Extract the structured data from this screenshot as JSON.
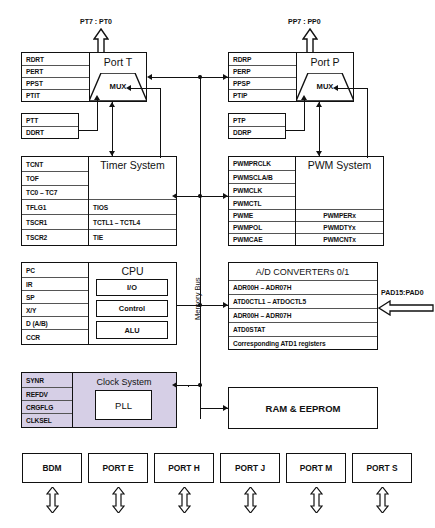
{
  "diagram": {
    "bus_label": "Memory Bus",
    "colors": {
      "line": "#111111",
      "clock_fill": "#d6cfe6",
      "background": "#ffffff"
    }
  },
  "port_t": {
    "header": "Port T",
    "pin_label": "PT7  : PT0",
    "mux_label": "MUX",
    "registers": [
      "RDRT",
      "PERT",
      "PPST",
      "PTIT"
    ],
    "data_registers": [
      "PTT",
      "DDRT"
    ]
  },
  "port_p": {
    "header": "Port P",
    "pin_label": "PP7  : PP0",
    "mux_label": "MUX",
    "registers": [
      "RDRP",
      "PERP",
      "PPSP",
      "PTIP"
    ],
    "data_registers": [
      "PTP",
      "DDRP"
    ]
  },
  "timer_system": {
    "header": "Timer System",
    "left_registers": [
      "TCNT",
      "TOF",
      "TC0 – TC7",
      "TFLG1",
      "TSCR1",
      "TSCR2"
    ],
    "right_registers": [
      "",
      "",
      "",
      "TIOS",
      "TCTL1 – TCTL4",
      "TIE"
    ]
  },
  "pwm_system": {
    "header": "PWM System",
    "left_registers": [
      "PWMPRCLK",
      "PWMSCLA/B",
      "PWMCLK",
      "PWMCTL",
      "PWME",
      "PWMPOL",
      "PWMCAE"
    ],
    "right_registers": [
      "",
      "",
      "",
      "",
      "PWMPERx",
      "PWMDTYx",
      "PWMCNTx"
    ]
  },
  "cpu": {
    "header": "CPU",
    "registers": [
      "PC",
      "IR",
      "SP",
      "X/Y",
      "D (A/B)",
      "CCR"
    ],
    "units": [
      "I/O",
      "Control",
      "ALU"
    ]
  },
  "adc": {
    "header": "A/D CONVERTERs 0/1",
    "rows": [
      "ADR00H – ADR07H",
      "ATD0CTL1 – ATDOCTL5",
      "ADR00H – ADR07H",
      "ATD0STAT",
      "Corresponding ATD1 registers"
    ],
    "pin_label": "PAD15:PAD0"
  },
  "clock_system": {
    "header": "Clock System",
    "registers": [
      "SYNR",
      "REFDV",
      "CRGFLG",
      "CLKSEL"
    ],
    "pll_label": "PLL"
  },
  "memory": {
    "label": "RAM & EEPROM"
  },
  "bottom_ports": [
    {
      "label": "BDM"
    },
    {
      "label": "PORT E"
    },
    {
      "label": "PORT H"
    },
    {
      "label": "PORT J"
    },
    {
      "label": "PORT M"
    },
    {
      "label": "PORT S"
    }
  ]
}
